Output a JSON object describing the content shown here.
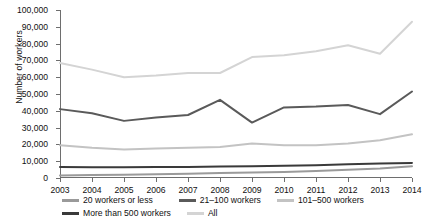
{
  "chart_data": {
    "type": "line",
    "title": "",
    "xlabel": "",
    "ylabel": "Number of workers",
    "categories": [
      2003,
      2004,
      2005,
      2006,
      2007,
      2008,
      2009,
      2010,
      2011,
      2012,
      2013,
      2014
    ],
    "xtick_labels": [
      "2003",
      "2004",
      "2005",
      "2006",
      "2007",
      "2008",
      "2009",
      "2010",
      "2011",
      "2012",
      "2013",
      "2014"
    ],
    "ytick_labels": [
      "0",
      "10,000",
      "20,000",
      "30,000",
      "40,000",
      "50,000",
      "60,000",
      "70,000",
      "80,000",
      "90,000",
      "100,000"
    ],
    "ytick_values": [
      0,
      10000,
      20000,
      30000,
      40000,
      50000,
      60000,
      70000,
      80000,
      90000,
      100000
    ],
    "ylim": [
      0,
      100000
    ],
    "xlim": [
      2003,
      2014
    ],
    "grid": false,
    "legend_position": "bottom",
    "series": [
      {
        "name": "20 workers or less",
        "color": "#9a9a9a",
        "values": [
          1500,
          1800,
          2000,
          2300,
          2600,
          3000,
          3200,
          3600,
          4200,
          4900,
          5700,
          7000
        ]
      },
      {
        "name": "21–100 workers",
        "color": "#5a5a5a",
        "values": [
          41000,
          38500,
          34000,
          36000,
          37500,
          46500,
          33000,
          42000,
          42500,
          43500,
          38000,
          51500
        ]
      },
      {
        "name": "101–500 workers",
        "color": "#c3c3c3",
        "values": [
          19500,
          18000,
          17000,
          17500,
          18000,
          18500,
          20500,
          19500,
          19500,
          20500,
          22500,
          26000
        ]
      },
      {
        "name": "More than 500 workers",
        "color": "#3a3a3a",
        "values": [
          6500,
          6400,
          6400,
          6500,
          6600,
          6800,
          7000,
          7300,
          7600,
          8200,
          8600,
          9000
        ]
      },
      {
        "name": "All",
        "color": "#d4d4d4",
        "values": [
          68500,
          64500,
          60000,
          61000,
          62500,
          62500,
          72000,
          73000,
          75500,
          79000,
          74000,
          93000
        ]
      }
    ],
    "legend": [
      {
        "label": "20 workers or less",
        "color": "#9a9a9a"
      },
      {
        "label": "21–100 workers",
        "color": "#5a5a5a"
      },
      {
        "label": "101–500 workers",
        "color": "#c3c3c3"
      },
      {
        "label": "More than 500 workers",
        "color": "#3a3a3a"
      },
      {
        "label": "All",
        "color": "#d4d4d4"
      }
    ]
  }
}
